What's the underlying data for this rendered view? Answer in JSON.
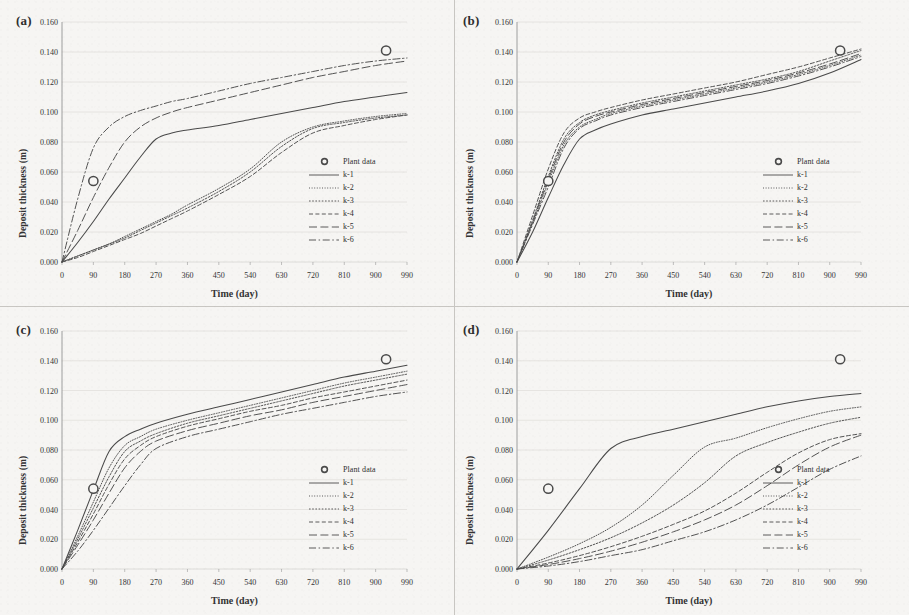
{
  "figure": {
    "background_color": "#f4f3f1",
    "line_color": "#4a4a4a",
    "marker_color": "#4a4a4a",
    "grid_color": "#d8d6d2"
  },
  "axes": {
    "xlabel": "Time (day)",
    "ylabel": "Deposit thickness (m)",
    "xticks": [
      "0",
      "90",
      "180",
      "270",
      "360",
      "450",
      "540",
      "630",
      "720",
      "810",
      "900",
      "990"
    ],
    "yticks": [
      "0.000",
      "0.020",
      "0.040",
      "0.060",
      "0.080",
      "0.100",
      "0.120",
      "0.140",
      "0.160"
    ],
    "xlim": [
      0,
      990
    ],
    "ylim": [
      0,
      0.16
    ]
  },
  "legend": {
    "marker_label": "Plant data",
    "entries": [
      {
        "label": "k-1",
        "style": "solid"
      },
      {
        "label": "k-2",
        "style": "fine-dot"
      },
      {
        "label": "k-3",
        "style": "dot"
      },
      {
        "label": "k-4",
        "style": "short-dash"
      },
      {
        "label": "k-5",
        "style": "long-dash"
      },
      {
        "label": "k-6",
        "style": "dash-dot"
      }
    ]
  },
  "panels": [
    {
      "tag": "(a)"
    },
    {
      "tag": "(b)"
    },
    {
      "tag": "(c)"
    },
    {
      "tag": "(d)"
    }
  ],
  "chart_data": [
    {
      "type": "line",
      "panel": "(a)",
      "title": "(a)",
      "xlabel": "Time (day)",
      "ylabel": "Deposit thickness (m)",
      "xlim": [
        0,
        990
      ],
      "ylim": [
        0,
        0.16
      ],
      "grid": true,
      "legend_position": "right-middle",
      "x": [
        0,
        45,
        90,
        135,
        180,
        225,
        270,
        315,
        360,
        450,
        540,
        630,
        720,
        810,
        900,
        990
      ],
      "series": [
        {
          "name": "k-1",
          "style": "solid",
          "values": [
            0.0,
            0.013,
            0.027,
            0.042,
            0.056,
            0.07,
            0.082,
            0.086,
            0.088,
            0.091,
            0.095,
            0.099,
            0.103,
            0.107,
            0.11,
            0.113
          ]
        },
        {
          "name": "k-2",
          "style": "fine-dot",
          "values": [
            0.0,
            0.004,
            0.008,
            0.012,
            0.017,
            0.022,
            0.027,
            0.032,
            0.038,
            0.049,
            0.062,
            0.08,
            0.09,
            0.094,
            0.097,
            0.099
          ]
        },
        {
          "name": "k-3",
          "style": "dot",
          "values": [
            0.0,
            0.004,
            0.008,
            0.012,
            0.016,
            0.021,
            0.026,
            0.031,
            0.036,
            0.047,
            0.06,
            0.077,
            0.089,
            0.093,
            0.096,
            0.098
          ]
        },
        {
          "name": "k-4",
          "style": "short-dash",
          "values": [
            0.0,
            0.003,
            0.007,
            0.011,
            0.015,
            0.019,
            0.024,
            0.029,
            0.034,
            0.045,
            0.057,
            0.073,
            0.086,
            0.091,
            0.095,
            0.098
          ]
        },
        {
          "name": "k-5",
          "style": "long-dash",
          "values": [
            0.0,
            0.021,
            0.043,
            0.063,
            0.08,
            0.09,
            0.096,
            0.1,
            0.103,
            0.108,
            0.113,
            0.118,
            0.123,
            0.127,
            0.131,
            0.134
          ]
        },
        {
          "name": "k-6",
          "style": "dash-dot",
          "values": [
            0.0,
            0.042,
            0.076,
            0.09,
            0.097,
            0.101,
            0.104,
            0.107,
            0.109,
            0.114,
            0.119,
            0.123,
            0.127,
            0.131,
            0.134,
            0.136
          ]
        }
      ],
      "markers": [
        {
          "label": "Plant data",
          "x": 90,
          "y": 0.054
        },
        {
          "label": "Plant data",
          "x": 930,
          "y": 0.141
        }
      ]
    },
    {
      "type": "line",
      "panel": "(b)",
      "title": "(b)",
      "xlabel": "Time (day)",
      "ylabel": "Deposit thickness (m)",
      "xlim": [
        0,
        990
      ],
      "ylim": [
        0,
        0.16
      ],
      "grid": true,
      "legend_position": "right-middle",
      "x": [
        0,
        45,
        90,
        135,
        180,
        225,
        270,
        360,
        450,
        540,
        630,
        720,
        810,
        900,
        990
      ],
      "series": [
        {
          "name": "k-1",
          "style": "solid",
          "values": [
            0.0,
            0.02,
            0.043,
            0.065,
            0.082,
            0.088,
            0.092,
            0.098,
            0.102,
            0.106,
            0.11,
            0.114,
            0.119,
            0.126,
            0.135
          ]
        },
        {
          "name": "k-2",
          "style": "fine-dot",
          "values": [
            0.0,
            0.026,
            0.053,
            0.078,
            0.09,
            0.095,
            0.099,
            0.104,
            0.108,
            0.112,
            0.116,
            0.12,
            0.125,
            0.131,
            0.138
          ]
        },
        {
          "name": "k-3",
          "style": "dot",
          "values": [
            0.0,
            0.028,
            0.057,
            0.082,
            0.093,
            0.098,
            0.101,
            0.106,
            0.11,
            0.114,
            0.118,
            0.122,
            0.127,
            0.134,
            0.141
          ]
        },
        {
          "name": "k-4",
          "style": "short-dash",
          "values": [
            0.0,
            0.031,
            0.062,
            0.086,
            0.096,
            0.1,
            0.103,
            0.108,
            0.112,
            0.116,
            0.12,
            0.125,
            0.13,
            0.136,
            0.142
          ]
        },
        {
          "name": "k-5",
          "style": "long-dash",
          "values": [
            0.0,
            0.027,
            0.055,
            0.08,
            0.092,
            0.097,
            0.1,
            0.105,
            0.109,
            0.113,
            0.117,
            0.121,
            0.126,
            0.132,
            0.139
          ]
        },
        {
          "name": "k-6",
          "style": "dash-dot",
          "values": [
            0.0,
            0.025,
            0.05,
            0.076,
            0.089,
            0.094,
            0.098,
            0.103,
            0.107,
            0.111,
            0.115,
            0.119,
            0.124,
            0.13,
            0.137
          ]
        }
      ],
      "markers": [
        {
          "label": "Plant data",
          "x": 90,
          "y": 0.054
        },
        {
          "label": "Plant data",
          "x": 930,
          "y": 0.141
        }
      ]
    },
    {
      "type": "line",
      "panel": "(c)",
      "title": "(c)",
      "xlabel": "Time (day)",
      "ylabel": "Deposit thickness (m)",
      "xlim": [
        0,
        990
      ],
      "ylim": [
        0,
        0.16
      ],
      "grid": true,
      "legend_position": "right-middle",
      "x": [
        0,
        45,
        90,
        135,
        180,
        225,
        270,
        360,
        450,
        540,
        630,
        720,
        810,
        900,
        990
      ],
      "series": [
        {
          "name": "k-1",
          "style": "solid",
          "values": [
            0.0,
            0.026,
            0.053,
            0.079,
            0.089,
            0.094,
            0.098,
            0.104,
            0.109,
            0.114,
            0.119,
            0.124,
            0.129,
            0.133,
            0.137
          ]
        },
        {
          "name": "k-2",
          "style": "fine-dot",
          "values": [
            0.0,
            0.022,
            0.045,
            0.068,
            0.083,
            0.089,
            0.094,
            0.1,
            0.105,
            0.11,
            0.115,
            0.12,
            0.125,
            0.129,
            0.133
          ]
        },
        {
          "name": "k-3",
          "style": "dot",
          "values": [
            0.0,
            0.02,
            0.041,
            0.062,
            0.079,
            0.086,
            0.091,
            0.098,
            0.103,
            0.108,
            0.113,
            0.118,
            0.123,
            0.127,
            0.131
          ]
        },
        {
          "name": "k-4",
          "style": "short-dash",
          "values": [
            0.0,
            0.018,
            0.037,
            0.057,
            0.074,
            0.083,
            0.089,
            0.096,
            0.101,
            0.106,
            0.11,
            0.115,
            0.119,
            0.123,
            0.127
          ]
        },
        {
          "name": "k-5",
          "style": "long-dash",
          "values": [
            0.0,
            0.016,
            0.033,
            0.051,
            0.068,
            0.079,
            0.086,
            0.093,
            0.098,
            0.103,
            0.107,
            0.112,
            0.116,
            0.12,
            0.124
          ]
        },
        {
          "name": "k-6",
          "style": "dash-dot",
          "values": [
            0.0,
            0.012,
            0.026,
            0.041,
            0.056,
            0.07,
            0.081,
            0.089,
            0.094,
            0.099,
            0.104,
            0.108,
            0.112,
            0.116,
            0.119
          ]
        }
      ],
      "markers": [
        {
          "label": "Plant data",
          "x": 90,
          "y": 0.054
        },
        {
          "label": "Plant data",
          "x": 930,
          "y": 0.141
        }
      ]
    },
    {
      "type": "line",
      "panel": "(d)",
      "title": "(d)",
      "xlabel": "Time (day)",
      "ylabel": "Deposit thickness (m)",
      "xlim": [
        0,
        990
      ],
      "ylim": [
        0,
        0.16
      ],
      "grid": true,
      "legend_position": "right-middle",
      "x": [
        0,
        90,
        180,
        270,
        360,
        450,
        540,
        630,
        720,
        810,
        900,
        990
      ],
      "series": [
        {
          "name": "k-1",
          "style": "solid",
          "values": [
            0.0,
            0.026,
            0.054,
            0.081,
            0.089,
            0.094,
            0.099,
            0.104,
            0.109,
            0.113,
            0.116,
            0.118
          ]
        },
        {
          "name": "k-2",
          "style": "fine-dot",
          "values": [
            0.0,
            0.008,
            0.017,
            0.028,
            0.043,
            0.063,
            0.082,
            0.088,
            0.095,
            0.101,
            0.106,
            0.109
          ]
        },
        {
          "name": "k-3",
          "style": "dot",
          "values": [
            0.0,
            0.006,
            0.013,
            0.021,
            0.031,
            0.043,
            0.058,
            0.076,
            0.085,
            0.092,
            0.098,
            0.102
          ]
        },
        {
          "name": "k-4",
          "style": "short-dash",
          "values": [
            0.0,
            0.004,
            0.009,
            0.015,
            0.022,
            0.03,
            0.039,
            0.051,
            0.065,
            0.078,
            0.087,
            0.091
          ]
        },
        {
          "name": "k-5",
          "style": "long-dash",
          "values": [
            0.0,
            0.003,
            0.007,
            0.012,
            0.018,
            0.025,
            0.033,
            0.043,
            0.056,
            0.07,
            0.082,
            0.09
          ]
        },
        {
          "name": "k-6",
          "style": "dash-dot",
          "values": [
            0.0,
            0.002,
            0.005,
            0.009,
            0.013,
            0.019,
            0.025,
            0.033,
            0.043,
            0.055,
            0.067,
            0.076
          ]
        }
      ],
      "markers": [
        {
          "label": "Plant data",
          "x": 90,
          "y": 0.054
        },
        {
          "label": "Plant data",
          "x": 930,
          "y": 0.141
        }
      ]
    }
  ]
}
